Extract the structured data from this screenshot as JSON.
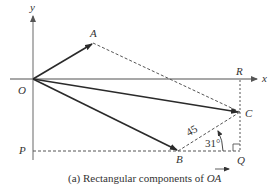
{
  "diagram": {
    "axes": {
      "x_label": "x",
      "y_label": "y"
    },
    "points": {
      "O": "O",
      "A": "A",
      "R": "R",
      "C": "C",
      "P": "P",
      "B": "B",
      "Q": "Q"
    },
    "measurements": {
      "length_BC": "45",
      "angle_CBQ": "31°"
    },
    "caption": {
      "prefix": "(a) Rectangular components of ",
      "vector": "OA"
    },
    "colors": {
      "axis": "#8a8a8a",
      "vector": "#2a2a2a",
      "dashed": "#555555"
    }
  }
}
